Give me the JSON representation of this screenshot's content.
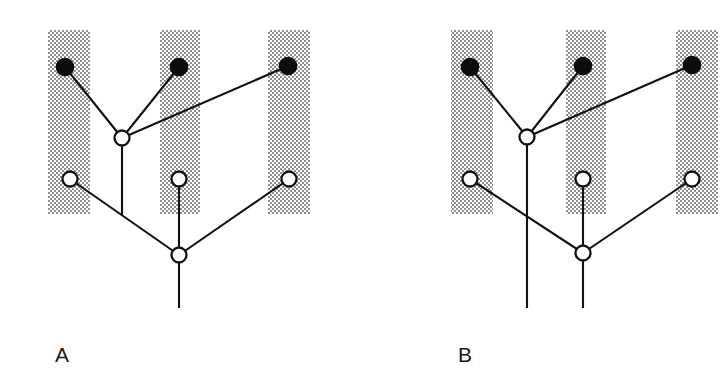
{
  "figure": {
    "type": "phylogenetic-tree-diagram",
    "background_color": "#ffffff",
    "line_color": "#111111",
    "band_color": "#b0b0b0",
    "filled_node_color": "#0d0d0d",
    "open_node_color": "#ffffff"
  },
  "panels": [
    {
      "id": "panel-a",
      "label": "A",
      "label_position": {
        "x": 55,
        "y": 362
      },
      "bands": [
        {
          "name": "band-left",
          "x": 48,
          "y": 30,
          "width": 42,
          "height": 184
        },
        {
          "name": "band-middle",
          "x": 160,
          "y": 30,
          "width": 40,
          "height": 184
        },
        {
          "name": "band-right",
          "x": 268,
          "y": 30,
          "width": 42,
          "height": 184
        }
      ],
      "nodes": [
        {
          "name": "filled-node-left",
          "type": "filled",
          "cx": 65,
          "cy": 67,
          "r": 8.5
        },
        {
          "name": "filled-node-middle",
          "type": "filled",
          "cx": 179,
          "cy": 67,
          "r": 8.5
        },
        {
          "name": "filled-node-right",
          "type": "filled",
          "cx": 288,
          "cy": 66,
          "r": 8.5
        },
        {
          "name": "open-node-upper-internal",
          "type": "open",
          "cx": 122,
          "cy": 138,
          "r": 7.5
        },
        {
          "name": "open-node-leaf-left",
          "type": "open",
          "cx": 70,
          "cy": 179,
          "r": 7.5
        },
        {
          "name": "open-node-leaf-middle",
          "type": "open",
          "cx": 179,
          "cy": 179,
          "r": 7.5
        },
        {
          "name": "open-node-leaf-right",
          "type": "open",
          "cx": 289,
          "cy": 179,
          "r": 7.5
        },
        {
          "name": "open-node-root",
          "type": "open",
          "cx": 179,
          "cy": 255,
          "r": 7.5
        }
      ],
      "branches": [
        {
          "name": "branch-filled-left-to-internal",
          "points": "65,67 122,138"
        },
        {
          "name": "branch-filled-middle-to-internal",
          "points": "179,67 122,138"
        },
        {
          "name": "branch-filled-right-to-internal",
          "points": "288,66 122,138"
        },
        {
          "name": "branch-internal-down-to-junction",
          "points": "122,138 122,216"
        },
        {
          "name": "branch-leaf-left-to-root",
          "points": "70,179 179,255"
        },
        {
          "name": "branch-leaf-middle-to-root",
          "points": "179,179 179,255"
        },
        {
          "name": "branch-leaf-right-to-root",
          "points": "289,179 179,255"
        },
        {
          "name": "branch-root-stem",
          "points": "179,255 179,308"
        }
      ]
    },
    {
      "id": "panel-b",
      "label": "B",
      "label_position": {
        "x": 458,
        "y": 362
      },
      "bands": [
        {
          "name": "band-left",
          "x": 451,
          "y": 30,
          "width": 42,
          "height": 184
        },
        {
          "name": "band-middle",
          "x": 566,
          "y": 30,
          "width": 40,
          "height": 184
        },
        {
          "name": "band-right",
          "x": 676,
          "y": 30,
          "width": 42,
          "height": 184
        }
      ],
      "nodes": [
        {
          "name": "filled-node-left",
          "type": "filled",
          "cx": 470,
          "cy": 67,
          "r": 8.5
        },
        {
          "name": "filled-node-middle",
          "type": "filled",
          "cx": 583,
          "cy": 66,
          "r": 8.5
        },
        {
          "name": "filled-node-right",
          "type": "filled",
          "cx": 692,
          "cy": 65,
          "r": 8.5
        },
        {
          "name": "open-node-upper-internal",
          "type": "open",
          "cx": 527,
          "cy": 137,
          "r": 7.5
        },
        {
          "name": "open-node-leaf-left",
          "type": "open",
          "cx": 470,
          "cy": 179,
          "r": 7.5
        },
        {
          "name": "open-node-leaf-middle",
          "type": "open",
          "cx": 583,
          "cy": 179,
          "r": 7.5
        },
        {
          "name": "open-node-leaf-right",
          "type": "open",
          "cx": 692,
          "cy": 179,
          "r": 7.5
        },
        {
          "name": "open-node-root",
          "type": "open",
          "cx": 583,
          "cy": 253,
          "r": 7.5
        }
      ],
      "branches": [
        {
          "name": "branch-filled-left-to-internal",
          "points": "470,67 527,137"
        },
        {
          "name": "branch-filled-middle-to-internal",
          "points": "583,66 527,137"
        },
        {
          "name": "branch-filled-right-to-internal",
          "points": "692,65 527,137"
        },
        {
          "name": "branch-internal-stem",
          "points": "527,137 527,308"
        },
        {
          "name": "branch-leaf-left-to-root",
          "points": "470,179 583,253"
        },
        {
          "name": "branch-leaf-middle-to-root",
          "points": "583,179 583,253"
        },
        {
          "name": "branch-leaf-right-to-root",
          "points": "692,179 583,253"
        },
        {
          "name": "branch-root-stem",
          "points": "583,253 583,308"
        }
      ]
    }
  ]
}
